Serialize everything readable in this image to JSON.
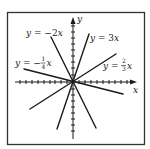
{
  "diagram": {
    "type": "lines-through-origin",
    "axes": {
      "x_label": "x",
      "y_label": "y"
    },
    "lines": [
      {
        "equation": "y = −2x",
        "slope": -2
      },
      {
        "equation": "y = 3x",
        "slope": 3
      },
      {
        "equation": "y = −1/4 x",
        "slope": -0.25
      },
      {
        "equation": "y = 2/3 x",
        "slope": 0.6667
      }
    ],
    "labels": {
      "neg2": {
        "prefix": "y = −2",
        "var": "x"
      },
      "pos3": {
        "prefix": "y = 3",
        "var": "x"
      },
      "negquarter": {
        "prefix": "y = −",
        "num": "1",
        "den": "4",
        "var": "x"
      },
      "twothirds": {
        "prefix": "y = ",
        "num": "2",
        "den": "3",
        "var": "x"
      }
    },
    "colors": {
      "ink": "#1a1a1a",
      "frame": "#333333",
      "background": "#ffffff"
    }
  }
}
